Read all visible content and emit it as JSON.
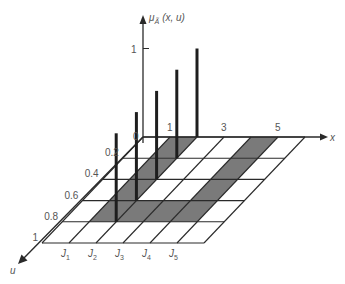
{
  "figure": {
    "vertical_axis_label": "μ",
    "vertical_axis_label_sub": "Ã",
    "vertical_axis_label_args": "(x, u)",
    "vertical_tick": "1",
    "x_axis_label": "x",
    "u_axis_label": "u",
    "origin_label": "0",
    "x_tick_labels": [
      {
        "value": 1,
        "label": "1"
      },
      {
        "value": 3,
        "label": "3"
      },
      {
        "value": 5,
        "label": "5"
      }
    ],
    "u_tick_labels": [
      {
        "value": 0.2,
        "label": "0.2"
      },
      {
        "value": 0.4,
        "label": "0.4"
      },
      {
        "value": 0.6,
        "label": "0.6"
      },
      {
        "value": 0.8,
        "label": "0.8"
      },
      {
        "value": 1,
        "label": "1"
      }
    ],
    "j_labels": [
      {
        "x": 1,
        "base": "J",
        "sub": "1"
      },
      {
        "x": 2,
        "base": "J",
        "sub": "2"
      },
      {
        "x": 3,
        "base": "J",
        "sub": "3"
      },
      {
        "x": 4,
        "base": "J",
        "sub": "4"
      },
      {
        "x": 5,
        "base": "J",
        "sub": "5"
      }
    ],
    "grid": {
      "x_count": 6,
      "u_count": 5,
      "u_step": 0.2
    },
    "shaded_cells": [
      {
        "u_index": 0,
        "x_index": 1
      },
      {
        "u_index": 1,
        "x_index": 1
      },
      {
        "u_index": 2,
        "x_index": 1
      },
      {
        "u_index": 3,
        "x_index": 1
      },
      {
        "u_index": 3,
        "x_index": 2
      },
      {
        "u_index": 3,
        "x_index": 3
      },
      {
        "u_index": 3,
        "x_index": 4
      },
      {
        "u_index": 2,
        "x_index": 4
      },
      {
        "u_index": 1,
        "x_index": 4
      },
      {
        "u_index": 0,
        "x_index": 4
      }
    ],
    "membership_bars": [
      {
        "x": 2,
        "u": 0,
        "membership": 1
      },
      {
        "x": 2,
        "u": 0.2,
        "membership": 1
      },
      {
        "x": 2,
        "u": 0.4,
        "membership": 1
      },
      {
        "x": 2,
        "u": 0.6,
        "membership": 1
      },
      {
        "x": 2,
        "u": 0.8,
        "membership": 1
      }
    ],
    "colors": {
      "shade": "#7a7a7a",
      "line": "#2a2a2a",
      "bar": "#1e1e1e",
      "text": "#555555"
    }
  }
}
